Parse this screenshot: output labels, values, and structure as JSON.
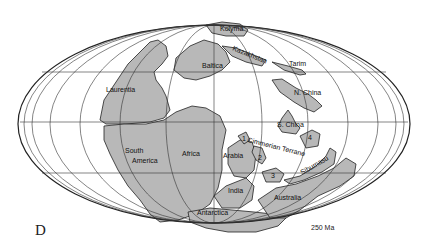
{
  "figure": {
    "panel_label": "D",
    "age_label": "250 Ma",
    "projection": "Mollweide (elliptical)",
    "land_color": "#b8b8b8",
    "ocean_color": "#ffffff",
    "line_color": "#222222"
  },
  "labels": {
    "kolyma": "Kolyma",
    "kazakhstan": "Kazakhstan",
    "tarim": "Tarim",
    "baltica": "Baltica",
    "laurentia": "Laurentia",
    "n_china": "N. China",
    "s_china": "S. China",
    "south": "South",
    "america": "America",
    "africa": "Africa",
    "arabia": "Arabia",
    "cimmerian": "Cimmerian Terrane",
    "sibumasu": "Sibumasu",
    "india": "India",
    "australia": "Australia",
    "antarctica": "Antarctica",
    "t1": "1",
    "t2": "2",
    "t3": "3",
    "t4": "4"
  }
}
